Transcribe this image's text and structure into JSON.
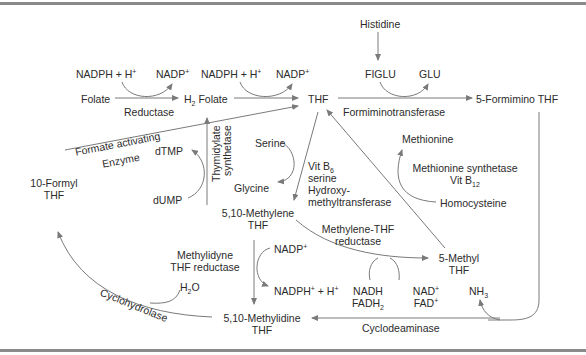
{
  "diagram": {
    "nodes": {
      "histidine": "Histidine",
      "figlu": "FIGLU",
      "glu": "GLU",
      "nadph_h_1": "NADPH + H",
      "nadp_1": "NADP",
      "nadph_h_2": "NADPH + H",
      "nadp_2": "NADP",
      "folate": "Folate",
      "h2folate_pre": "H",
      "h2folate_sub": "2",
      "h2folate_post": " Folate",
      "thf": "THF",
      "formimino_thf": "5-Formimino THF",
      "serine": "Serine",
      "glycine": "Glycine",
      "dtmp": "dTMP",
      "dump": "dUMP",
      "formyl_thf_line1": "10-Formyl",
      "formyl_thf_line2": "THF",
      "methylene_thf_line1": "5,10-Methylene",
      "methylene_thf_line2": "THF",
      "methionine": "Methionine",
      "homocysteine": "Homocysteine",
      "methyl_thf_line1": "5-Methyl",
      "methyl_thf_line2": "THF",
      "nadp_3": "NADP",
      "nadph_h_3": "NADPH",
      "nadph_h_3_tail": " + H",
      "nadh": "NADH",
      "fadh2_pre": "FADH",
      "fadh2_sub": "2",
      "nad": "NAD",
      "fad": "FAD",
      "nh3_pre": "NH",
      "nh3_sub": "3",
      "h2o_pre": "H",
      "h2o_sub": "2",
      "h2o_post": "O",
      "methylidine_thf_line1": "5,10-Methylidine",
      "methylidine_thf_line2": "THF"
    },
    "enzymes": {
      "reductase": "Reductase",
      "formiminotransferase": "Formiminotransferase",
      "formate_activating_line1": "Formate activating",
      "formate_activating_line2": "Enzyme",
      "thymidylate_line1": "Thymidylate",
      "thymidylate_line2": "synthetase",
      "vit_b6_pre": "Vit B",
      "vit_b6_sub": "6",
      "serine_hmt_line1": "serine",
      "serine_hmt_line2": "Hydroxy-",
      "serine_hmt_line3": "methyltransferase",
      "methionine_synthetase": "Methionine synthetase",
      "vit_b12_pre": "Vit B",
      "vit_b12_sub": "12",
      "methylene_thf_reductase_line1": "Methylene-THF",
      "methylene_thf_reductase_line2": "reductase",
      "methylidyne_reductase_line1": "Methylidyne",
      "methylidyne_reductase_line2": "THF reductase",
      "cyclohydrolase": "Cyclohydrolase",
      "cyclodeaminase": "Cyclodeaminase"
    },
    "superscripts": {
      "plus": "+"
    },
    "colors": {
      "line": "#7a7a7a",
      "text": "#2b2b2b",
      "frame": "#8a8a8a",
      "background": "#ffffff"
    }
  }
}
